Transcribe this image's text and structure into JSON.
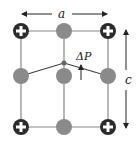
{
  "diagram": {
    "title": "",
    "labels": {
      "a": "a",
      "c": "c",
      "delta_p": "ΔP"
    },
    "colors": {
      "bond": "#888888",
      "neutral_atom": "#8a8a8a",
      "positive_ion_fill": "#2b2b2b",
      "positive_ion_sign": "#ffffff",
      "arrow": "#222222"
    },
    "atoms": {
      "corner_positive_ions": 4,
      "gray_atoms": 5,
      "small_center_atom": 1
    }
  }
}
